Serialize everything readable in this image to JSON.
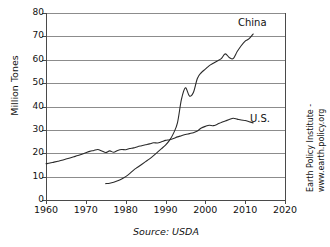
{
  "chart_data": {
    "type": "line",
    "title": "",
    "xlabel": "",
    "ylabel": "Million Tones",
    "source": "Source: USDA",
    "xlim": [
      1960,
      2020
    ],
    "ylim": [
      0,
      80
    ],
    "grid": "horizontal",
    "legend_position": "inline-end-of-line",
    "x_ticks": [
      "1960",
      "1970",
      "1980",
      "1990",
      "2000",
      "2010",
      "2020"
    ],
    "y_ticks": [
      "0",
      "10",
      "20",
      "30",
      "40",
      "50",
      "60",
      "70",
      "80"
    ],
    "credit_line_1": "Earth Policy Institute -",
    "credit_line_2": "www.earth.policy.org",
    "series": [
      {
        "name": "China",
        "label": "China",
        "x": [
          1975,
          1976,
          1977,
          1978,
          1979,
          1980,
          1981,
          1982,
          1983,
          1984,
          1985,
          1986,
          1987,
          1988,
          1989,
          1990,
          1991,
          1992,
          1993,
          1994,
          1995,
          1996,
          1997,
          1998,
          1999,
          2000,
          2001,
          2002,
          2003,
          2004,
          2005,
          2006,
          2007,
          2008,
          2009,
          2010,
          2011,
          2012
        ],
        "values": [
          7.0,
          7.2,
          7.6,
          8.2,
          9.0,
          10.0,
          11.3,
          12.8,
          14.0,
          15.2,
          16.4,
          17.6,
          19.0,
          20.5,
          22.0,
          23.5,
          25.5,
          28.5,
          33.0,
          43.0,
          48.0,
          44.5,
          46.0,
          52.0,
          54.5,
          56.0,
          57.5,
          58.5,
          59.5,
          60.5,
          62.5,
          61.0,
          60.5,
          63.5,
          66.0,
          68.0,
          69.0,
          71.0
        ]
      },
      {
        "name": "U.S.",
        "label": "U.S.",
        "x": [
          1960,
          1961,
          1962,
          1963,
          1964,
          1965,
          1966,
          1967,
          1968,
          1969,
          1970,
          1971,
          1972,
          1973,
          1974,
          1975,
          1976,
          1977,
          1978,
          1979,
          1980,
          1981,
          1982,
          1983,
          1984,
          1985,
          1986,
          1987,
          1988,
          1989,
          1990,
          1991,
          1992,
          1993,
          1994,
          1995,
          1996,
          1997,
          1998,
          1999,
          2000,
          2001,
          2002,
          2003,
          2004,
          2005,
          2006,
          2007,
          2008,
          2009,
          2010,
          2011,
          2012
        ],
        "values": [
          15.5,
          15.8,
          16.2,
          16.6,
          17.0,
          17.5,
          18.0,
          18.5,
          19.0,
          19.6,
          20.2,
          20.8,
          21.2,
          21.6,
          21.0,
          20.3,
          21.0,
          20.4,
          21.2,
          21.6,
          21.5,
          22.0,
          22.3,
          22.8,
          23.2,
          23.6,
          24.0,
          24.5,
          24.4,
          24.9,
          25.5,
          25.8,
          26.3,
          27.0,
          27.5,
          28.0,
          28.4,
          28.8,
          29.5,
          30.8,
          31.5,
          32.0,
          31.8,
          32.4,
          33.2,
          33.8,
          34.4,
          35.0,
          34.6,
          34.2,
          34.0,
          33.5,
          33.0
        ]
      }
    ]
  }
}
